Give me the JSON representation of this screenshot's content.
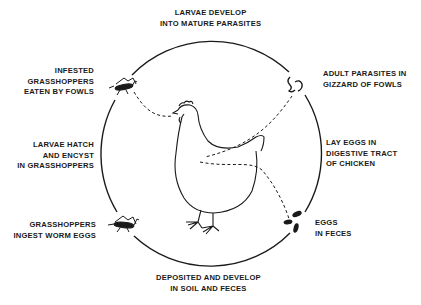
{
  "diagram": {
    "type": "life-cycle",
    "stages": [
      {
        "id": "top",
        "lines": [
          "LARVAE DEVELOP",
          "INTO MATURE PARASITES"
        ]
      },
      {
        "id": "adult",
        "lines": [
          "ADULT PARASITES IN",
          "GIZZARD OF FOWLS"
        ]
      },
      {
        "id": "lay",
        "lines": [
          "LAY EGGS IN",
          "DIGESTIVE TRACT",
          "OF CHICKEN"
        ]
      },
      {
        "id": "eggs",
        "lines": [
          "EGGS",
          "IN FECES"
        ]
      },
      {
        "id": "deposited",
        "lines": [
          "DEPOSITED AND DEVELOP",
          "IN SOIL AND FECES"
        ]
      },
      {
        "id": "ingest",
        "lines": [
          "GRASSHOPPERS",
          "INGEST WORM EGGS"
        ]
      },
      {
        "id": "hatch",
        "lines": [
          "LARVAE HATCH",
          "AND ENCYST",
          "IN GRASSHOPPERS"
        ]
      },
      {
        "id": "infested",
        "lines": [
          "INFESTED",
          "GRASSHOPPERS",
          "EATEN BY FOWLS"
        ]
      }
    ],
    "icons": [
      "chicken-icon",
      "grasshopper-icon",
      "worm-icon",
      "eggs-icon"
    ],
    "colors": {
      "line": "#1a1a1a",
      "background": "#ffffff"
    }
  }
}
